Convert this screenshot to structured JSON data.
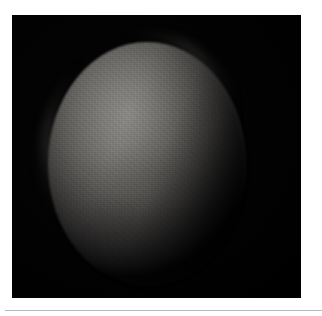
{
  "page": {
    "background_color": "#ffffff",
    "width": 322,
    "height": 316
  },
  "figure": {
    "name": "astronomical-disk-image",
    "plate": {
      "background_color": "#000000",
      "x": 12,
      "y": 15,
      "width": 289,
      "height": 283
    },
    "subject": {
      "type": "planetary-disk",
      "shape": "ellipse",
      "center_x": 135,
      "center_y": 149,
      "width": 198,
      "height": 244,
      "illumination": "upper-left",
      "terminator_side": "lower-right",
      "peak_brightness_color": "#8a8884",
      "mid_brightness_color": "#5c5b58",
      "limb_color": "#121212",
      "surface_texture": "fine mottled sensor noise"
    }
  },
  "bottom_rule": {
    "color": "#b9b9b9",
    "x": 5,
    "y": 310,
    "width": 317,
    "height": 1
  },
  "text": {
    "caption": "",
    "labels": [],
    "annotations": []
  }
}
